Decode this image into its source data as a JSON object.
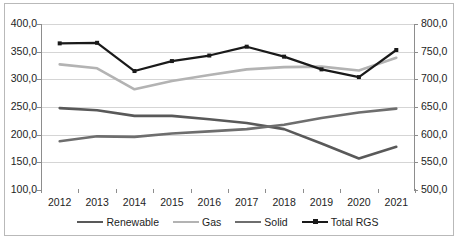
{
  "chart_data": {
    "type": "line",
    "title": "",
    "xlabel": "",
    "ylabel": "",
    "categories": [
      "2012",
      "2013",
      "2014",
      "2015",
      "2016",
      "2017",
      "2018",
      "2019",
      "2020",
      "2021"
    ],
    "axes": {
      "left": {
        "ylim": [
          100.0,
          400.0
        ],
        "tick_step": 50.0,
        "ticks": [
          "100,0",
          "150,0",
          "200,0",
          "250,0",
          "300,0",
          "350,0",
          "400,0"
        ],
        "tick_values": [
          100.0,
          150.0,
          200.0,
          250.0,
          300.0,
          350.0,
          400.0
        ]
      },
      "right": {
        "ylim": [
          500.0,
          800.0
        ],
        "tick_step": 50.0,
        "ticks": [
          "500,0",
          "550,0",
          "600,0",
          "650,0",
          "700,0",
          "750,0",
          "800,0"
        ],
        "tick_values": [
          500.0,
          550.0,
          600.0,
          650.0,
          700.0,
          750.0,
          800.0
        ]
      }
    },
    "grid": true,
    "legend_position": "bottom",
    "series": [
      {
        "name": "Renewable",
        "axis": "left",
        "color": "#595959",
        "width": 2.6,
        "marker": false,
        "values": [
          248.0,
          244.0,
          234.0,
          234.0,
          228.0,
          221.0,
          210.0,
          184.0,
          157.0,
          178.0
        ]
      },
      {
        "name": "Gas",
        "axis": "left",
        "color": "#b3b3b3",
        "width": 2.6,
        "marker": false,
        "values": [
          327.0,
          320.0,
          282.0,
          297.0,
          308.0,
          318.0,
          322.0,
          323.0,
          316.0,
          339.0
        ]
      },
      {
        "name": "Solid",
        "axis": "left",
        "color": "#6e6e6e",
        "width": 2.6,
        "marker": false,
        "values": [
          188.0,
          197.0,
          196.0,
          202.0,
          206.0,
          210.0,
          218.0,
          230.0,
          240.0,
          247.0
        ]
      },
      {
        "name": "Total RGS",
        "axis": "right",
        "color": "#1a1a1a",
        "width": 2.2,
        "marker": true,
        "values": [
          765.0,
          766.0,
          715.0,
          733.0,
          743.0,
          759.0,
          741.0,
          718.0,
          704.0,
          753.0
        ]
      }
    ]
  },
  "legend": {
    "items": [
      {
        "label": "Renewable",
        "color": "#595959",
        "marker": false
      },
      {
        "label": "Gas",
        "color": "#b3b3b3",
        "marker": false
      },
      {
        "label": "Solid",
        "color": "#6e6e6e",
        "marker": false
      },
      {
        "label": "Total RGS",
        "color": "#1a1a1a",
        "marker": true
      }
    ]
  },
  "caption": ""
}
